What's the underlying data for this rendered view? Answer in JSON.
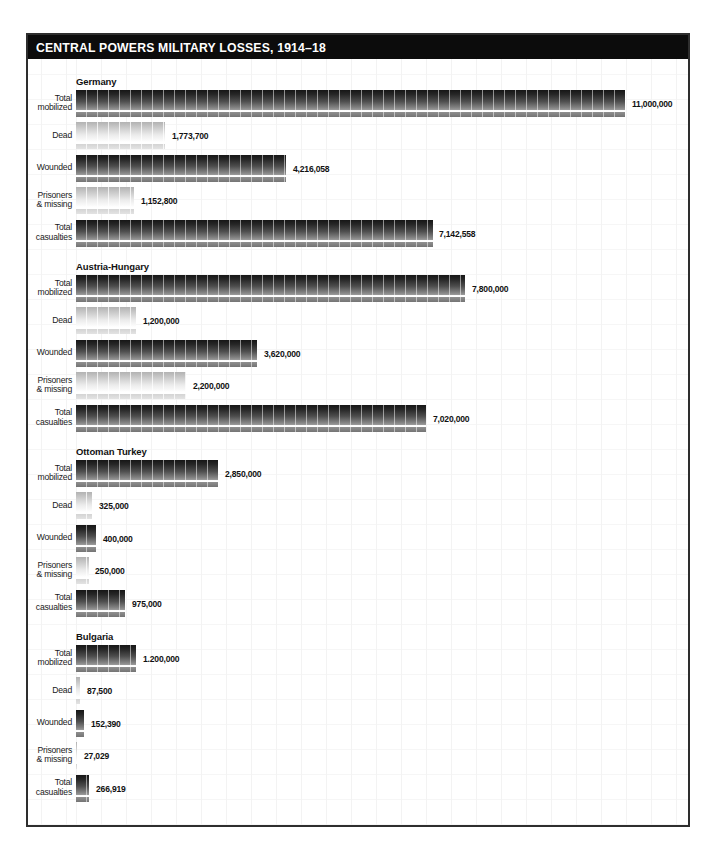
{
  "title": "CENTRAL POWERS MILITARY LOSSES, 1914–18",
  "chart_data": {
    "type": "bar",
    "orientation": "horizontal",
    "title": "CENTRAL POWERS MILITARY LOSSES, 1914–18",
    "xlabel": "",
    "ylabel": "",
    "xlim": [
      0,
      11000000
    ],
    "grid": "faint",
    "legend": "none",
    "categories": [
      "Total mobilized",
      "Dead",
      "Wounded",
      "Prisoners & missing",
      "Total casualties"
    ],
    "category_label_lines": [
      [
        "Total",
        "mobilized"
      ],
      [
        "Dead"
      ],
      [
        "Wounded"
      ],
      [
        "Prisoners",
        "& missing"
      ],
      [
        "Total",
        "casualties"
      ]
    ],
    "bar_styles": [
      "dark",
      "light",
      "dark",
      "light",
      "dark"
    ],
    "series": [
      {
        "name": "Germany",
        "values": [
          11000000,
          1773700,
          4216058,
          1152800,
          7142558
        ],
        "value_labels": [
          "11,000,000",
          "1,773,700",
          "4,216,058",
          "1,152,800",
          "7,142,558"
        ]
      },
      {
        "name": "Austria-Hungary",
        "values": [
          7800000,
          1200000,
          3620000,
          2200000,
          7020000
        ],
        "value_labels": [
          "7,800,000",
          "1,200,000",
          "3,620,000",
          "2,200,000",
          "7,020,000"
        ]
      },
      {
        "name": "Ottoman Turkey",
        "values": [
          2850000,
          325000,
          400000,
          250000,
          975000
        ],
        "value_labels": [
          "2,850,000",
          "325,000",
          "400,000",
          "250,000",
          "975,000"
        ]
      },
      {
        "name": "Bulgaria",
        "values": [
          1200000,
          87500,
          152390,
          27029,
          266919
        ],
        "value_labels": [
          "1.200,000",
          "87,500",
          "152,390",
          "27,029",
          "266,919"
        ]
      }
    ],
    "colors": {
      "title_bg": "#0c0c0c",
      "title_fg": "#ffffff",
      "frame_border": "#2e2e2e",
      "dark_bar_top": "#161616",
      "dark_bar_bottom": "#747474",
      "light_bar_top": "#b2b2b2",
      "light_bar_bottom": "#e3e3e3",
      "grid_line": "#f3f3f3",
      "label_text": "#1a1a1a"
    }
  }
}
